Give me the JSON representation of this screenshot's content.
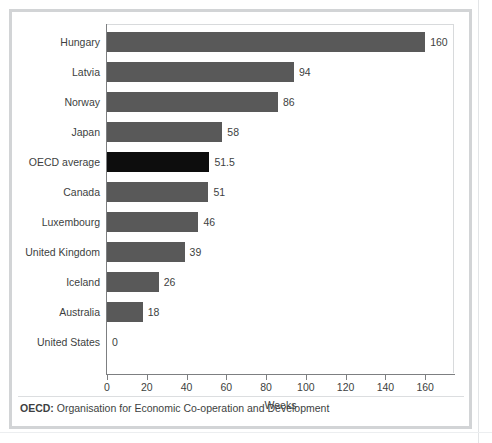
{
  "chart_data": {
    "type": "bar",
    "orientation": "horizontal",
    "title": "",
    "xlabel": "Weeks",
    "ylabel": "",
    "xlim": [
      0,
      175
    ],
    "xticks": [
      0,
      20,
      40,
      60,
      80,
      100,
      120,
      140,
      160
    ],
    "grid": false,
    "legend": "none",
    "categories": [
      "Hungary",
      "Latvia",
      "Norway",
      "Japan",
      "OECD average",
      "Canada",
      "Luxembourg",
      "United Kingdom",
      "Iceland",
      "Australia",
      "United States"
    ],
    "values": [
      160,
      94,
      86,
      58,
      51.5,
      51,
      46,
      39,
      26,
      18,
      0
    ],
    "value_labels": [
      "160",
      "94",
      "86",
      "58",
      "51.5",
      "51",
      "46",
      "39",
      "26",
      "18",
      "0"
    ],
    "highlight_category": "OECD average",
    "colors": {
      "bar": "#595959",
      "bar_highlight": "#0d0d0d",
      "axis": "#7d7f81",
      "text": "#3d3f41",
      "frame": "#d2d4d6",
      "plot_border": "#d8dadc",
      "background": "#ffffff"
    }
  },
  "footnote": {
    "abbr": "OECD:",
    "text": " Organisation for Economic Co-operation and Development"
  }
}
